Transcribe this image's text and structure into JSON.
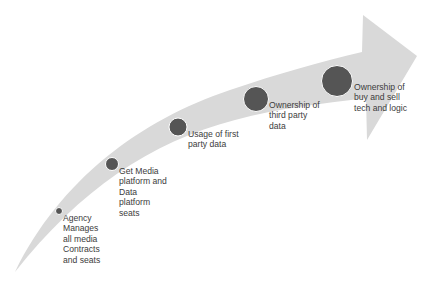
{
  "diagram": {
    "type": "curved-progression-arrow",
    "colors": {
      "arrow_fill": "#d9d9d9",
      "milestone_fill": "#555555",
      "milestone_stroke": "#ffffff",
      "text": "#3c3c3c"
    },
    "milestones": [
      {
        "label": "Agency\nManages\nall media\nContracts\nand seats",
        "cx": 59,
        "cy": 211,
        "r": 3.5,
        "text_x": 63,
        "text_y": 213
      },
      {
        "label": "Get Media\nplatform and\nData\nplatform\nseats",
        "cx": 112,
        "cy": 164,
        "r": 6.5,
        "text_x": 119,
        "text_y": 166
      },
      {
        "label": "Usage of first\nparty data",
        "cx": 178,
        "cy": 127,
        "r": 9,
        "text_x": 188,
        "text_y": 129
      },
      {
        "label": "Ownership of\nthird party\ndata",
        "cx": 256,
        "cy": 99,
        "r": 12.5,
        "text_x": 269,
        "text_y": 100
      },
      {
        "label": "Ownership of\nbuy and sell\ntech and logic",
        "cx": 337,
        "cy": 81,
        "r": 15.5,
        "text_x": 354,
        "text_y": 82
      }
    ]
  }
}
